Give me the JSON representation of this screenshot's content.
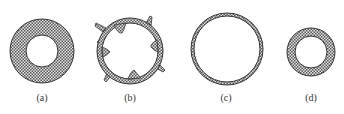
{
  "figure": {
    "panels": [
      {
        "id": "a",
        "label": "(a)",
        "shape": "thick-ring",
        "cx": 42,
        "cy": 51,
        "outer_r": 32,
        "inner_r": 16
      },
      {
        "id": "b",
        "label": "(b)",
        "shape": "spiked-lobed-ring",
        "cx": 130,
        "cy": 51,
        "outer_r": 32,
        "thickness": 5
      },
      {
        "id": "c",
        "label": "(c)",
        "shape": "thin-ring",
        "cx": 227,
        "cy": 49,
        "outer_r": 36,
        "thickness": 3
      },
      {
        "id": "d",
        "label": "(d)",
        "shape": "small-ring",
        "cx": 311,
        "cy": 52,
        "outer_r": 24,
        "inner_r": 16
      }
    ],
    "colors": {
      "stroke": "#333333",
      "hatch_dark": "#555555",
      "hatch_light": "#e6e6e6",
      "background": "#ffffff"
    }
  }
}
